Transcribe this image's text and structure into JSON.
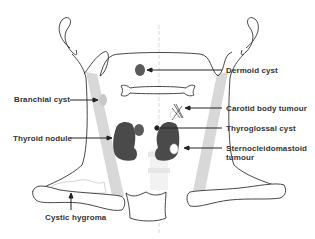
{
  "diagram": {
    "labels": {
      "dermoid_cyst": "Dermoid cyst",
      "branchial_cyst": "Branchial cyst",
      "carotid_body_tumour": "Carotid body tumour",
      "thyroid_nodule": "Thyroid nodule",
      "thyroglossal_cyst": "Thyroglossal cyst",
      "sternocleidomastoid_tumour_line1": "Sternocleidomastoid",
      "sternocleidomastoid_tumour_line2": "tumour",
      "cystic_hygroma": "Cystic hygroma"
    },
    "colors": {
      "outline": "#333333",
      "muscle": "#d6d6d6",
      "thyroid": "#4a4a4a",
      "cyst": "#5a5a5a",
      "label_text": "#333333",
      "midline": "#e4e4e4"
    }
  }
}
